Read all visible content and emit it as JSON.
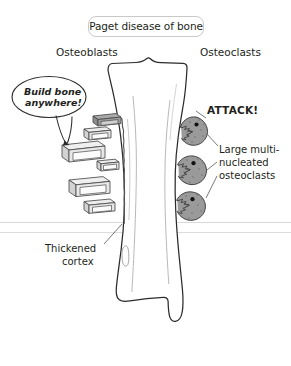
{
  "figure": {
    "title": "Paget disease of bone",
    "background_color": "#ffffff",
    "ink_color": "#231f20"
  },
  "headings": {
    "left": "Osteoblasts",
    "right": "Osteoclasts"
  },
  "speech_bubble": {
    "name": "build-bone-speech-bubble",
    "line1": "Build bone",
    "line2": "anywhere!",
    "style": "italic"
  },
  "callouts": {
    "attack": "ATTACK!",
    "osteoclast_label": {
      "line1": "Large multi-",
      "line2": "nucleated",
      "line3": "osteoclasts"
    },
    "cortex_label": {
      "line1": "Thickened",
      "line2": "cortex"
    }
  },
  "anatomy": {
    "bone_name": "tibia",
    "bone_fill": "#ffffff",
    "bone_outline": "#2b2b2b",
    "cortex_note": "irregular thickened left cortex"
  },
  "cells": {
    "osteoblasts": {
      "count": 6,
      "shape": "isometric-box",
      "fill": "#e8e8e8",
      "outline": "#4a4a4a"
    },
    "osteoclasts": {
      "count": 3,
      "shape": "pac-man-with-teeth",
      "fill": "#9a9a9a",
      "outline": "#3a3a3a",
      "nucleus_color": "#111111"
    }
  },
  "guide_lines": {
    "count": 2,
    "color": "#d7d7d7"
  }
}
